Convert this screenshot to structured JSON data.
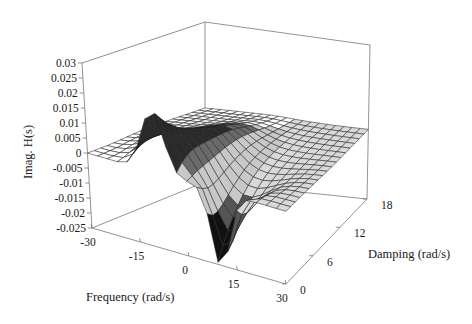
{
  "chart_data": {
    "type": "surface3d",
    "title": "",
    "xlabel": "Frequency (rad/s)",
    "ylabel": "Damping (rad/s)",
    "zlabel": "Imag. H(s)",
    "x_ticks": [
      "-30",
      "-15",
      "0",
      "15",
      "30"
    ],
    "x_tick_values": [
      -30,
      -15,
      0,
      15,
      30
    ],
    "y_ticks": [
      "0",
      "6",
      "12",
      "18"
    ],
    "y_tick_values": [
      0,
      6,
      12,
      18
    ],
    "z_ticks": [
      "0.03",
      "0.025",
      "0.02",
      "0.015",
      "0.01",
      "0.005",
      "0",
      "-0.005",
      "-0.01",
      "-0.015",
      "-0.02",
      "-0.025"
    ],
    "z_tick_values": [
      0.03,
      0.025,
      0.02,
      0.015,
      0.01,
      0.005,
      0,
      -0.005,
      -0.01,
      -0.015,
      -0.02,
      -0.025
    ],
    "xlim": [
      -30,
      30
    ],
    "ylim": [
      0,
      18
    ],
    "zlim": [
      -0.025,
      0.03
    ],
    "grid": false,
    "legend": null,
    "surface": {
      "description": "Imaginary part of transfer function H(s) over s = damping + j*frequency; positive peak near frequency -10 rad/s at low damping (~0.02), negative trough near frequency +10 rad/s at low damping (~-0.025), flattening toward 0 as damping increases",
      "peaks": [
        {
          "frequency": -10,
          "damping": 0,
          "value": 0.021
        },
        {
          "frequency": 10,
          "damping": 0,
          "value": -0.025
        }
      ],
      "grid_resolution": {
        "frequency_steps": 20,
        "damping_steps": 18
      }
    }
  }
}
